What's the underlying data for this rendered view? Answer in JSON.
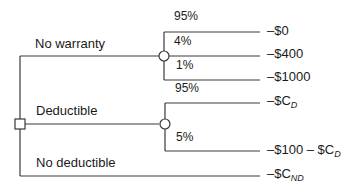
{
  "diagram": {
    "type": "decision-tree",
    "decision_node": {
      "branches": [
        {
          "label": "No warranty",
          "chance_node": {
            "outcomes": [
              {
                "probability": "95%",
                "payoff": "–$0"
              },
              {
                "probability": "4%",
                "payoff": "–$400"
              },
              {
                "probability": "1%",
                "payoff": "–$1000"
              }
            ]
          }
        },
        {
          "label": "Deductible",
          "chance_node": {
            "outcomes": [
              {
                "probability": "95%",
                "payoff_main": "–$C",
                "payoff_sub": "D"
              },
              {
                "probability": "5%",
                "payoff_main": "–$100 – $C",
                "payoff_sub": "D"
              }
            ]
          }
        },
        {
          "label": "No deductible",
          "payoff_main": "–$C",
          "payoff_sub": "ND"
        }
      ]
    },
    "colors": {
      "line": "#3a3a3a",
      "text": "#1a1a1a",
      "background": "#ffffff"
    }
  }
}
